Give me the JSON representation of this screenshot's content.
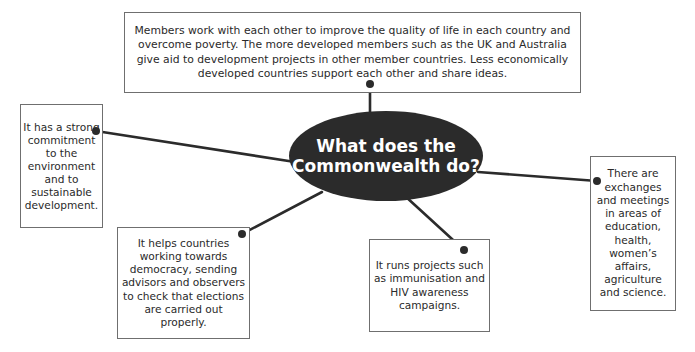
{
  "diagram": {
    "type": "mind-map",
    "colors": {
      "center_fill": "#2b2b2b",
      "center_text": "#ffffff",
      "connector": "#2b2b2b",
      "box_border": "#6f6f6f"
    },
    "center": {
      "title": "What does the Commonwealth do?"
    },
    "branches": [
      {
        "id": "top",
        "text": "Members work with each other to improve the quality of life in each country and overcome poverty. The more developed members such as the UK and Australia give aid to development projects in other member countries. Less economically developed countries support each other and share ideas."
      },
      {
        "id": "left",
        "text": "It has a strong commitment to the environment and to sustainable development."
      },
      {
        "id": "right",
        "text": "There are exchanges and meetings in areas of education, health, women’s affairs, agriculture and science."
      },
      {
        "id": "bottom-left",
        "text": "It helps countries working towards democracy, sending advisors and observers to check that elections are carried out properly."
      },
      {
        "id": "bottom-center",
        "text": "It runs projects such as immunisation and HIV awareness campaigns."
      }
    ]
  }
}
